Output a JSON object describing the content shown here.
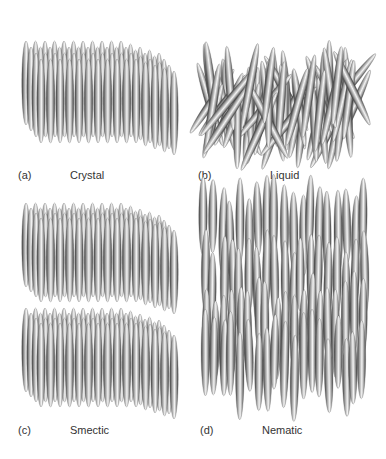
{
  "figure": {
    "panels": [
      {
        "id": "a",
        "letter": "(a)",
        "name": "Crystal",
        "phase": "crystal",
        "box": {
          "x": 18,
          "y": 38,
          "w": 150,
          "h": 125
        },
        "label_letter_pos": {
          "x": 18,
          "y": 169
        },
        "label_name_pos": {
          "x": 70,
          "y": 169
        }
      },
      {
        "id": "b",
        "letter": "(b)",
        "name": "Liquid",
        "phase": "liquid",
        "box": {
          "x": 205,
          "y": 42,
          "w": 160,
          "h": 125
        },
        "label_letter_pos": {
          "x": 198,
          "y": 169
        },
        "label_name_pos": {
          "x": 270,
          "y": 169
        }
      },
      {
        "id": "c",
        "letter": "(c)",
        "name": "Smectic",
        "phase": "smectic",
        "box": {
          "x": 18,
          "y": 190,
          "w": 150,
          "h": 230
        },
        "label_letter_pos": {
          "x": 18,
          "y": 424
        },
        "label_name_pos": {
          "x": 70,
          "y": 424
        }
      },
      {
        "id": "d",
        "letter": "(d)",
        "name": "Nematic",
        "phase": "nematic",
        "box": {
          "x": 200,
          "y": 190,
          "w": 170,
          "h": 230
        },
        "label_letter_pos": {
          "x": 200,
          "y": 424
        },
        "label_name_pos": {
          "x": 262,
          "y": 424
        }
      }
    ],
    "colors": {
      "edge": "#3a3a3a",
      "mid": "#9a9a9a",
      "highlight": "#f4f4f4",
      "label": "#333333"
    }
  }
}
